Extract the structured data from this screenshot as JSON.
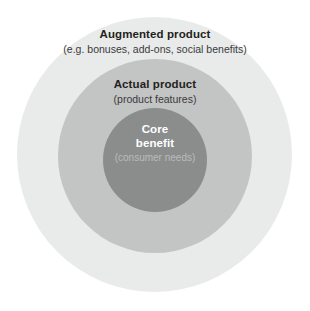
{
  "diagram": {
    "type": "concentric-circles",
    "background_color": "#ffffff",
    "layers": [
      {
        "id": "augmented",
        "name": "augmented-product-ring",
        "title": "Augmented product",
        "subtitle": "(e.g. bonuses, add-ons, social benefits)",
        "fill_color": "#e9eaea",
        "title_color": "#231f20",
        "subtitle_color": "#3a3a3a"
      },
      {
        "id": "actual",
        "name": "actual-product-ring",
        "title": "Actual product",
        "subtitle": "(product features)",
        "fill_color": "#c3c4c4",
        "title_color": "#231f20",
        "subtitle_color": "#3a3a3a"
      },
      {
        "id": "core",
        "name": "core-benefit-circle",
        "title_line1": "Core",
        "title_line2": "benefit",
        "subtitle": "(consumer needs)",
        "fill_color": "#8b8d8d",
        "title_color": "#ffffff",
        "subtitle_color": "#b9bbbb"
      }
    ]
  }
}
